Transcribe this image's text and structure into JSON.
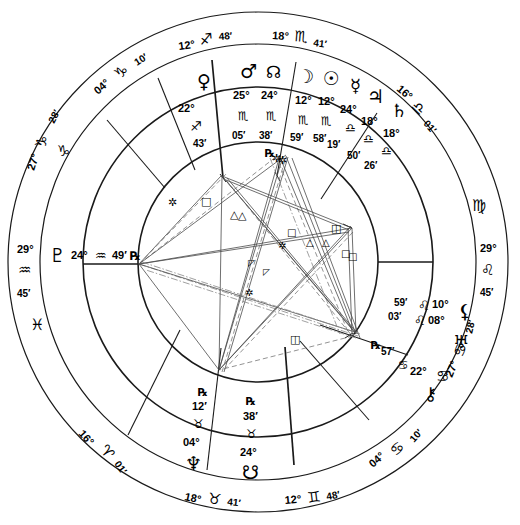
{
  "chart": {
    "type": "astrological-natal-wheel",
    "zodiac_glyphs": {
      "aries": "♈",
      "taurus": "♉",
      "gemini": "♊",
      "cancer": "♋",
      "leo": "♌",
      "virgo": "♍",
      "libra": "♎",
      "scorpio": "♏",
      "sagittarius": "♐",
      "capricorn": "♑",
      "aquarius": "♒",
      "pisces": "♓"
    },
    "planet_glyphs": {
      "sun": "☉",
      "moon": "☽",
      "mercury": "☿",
      "venus": "♀",
      "mars": "♂",
      "jupiter": "♃",
      "saturn": "♄",
      "uranus": "♅",
      "neptune": "♆",
      "pluto": "♇",
      "north_node": "☊",
      "south_node": "☋",
      "chiron": "⚷",
      "lilith": "⚸",
      "retrograde": "℞"
    },
    "house_cusps": [
      {
        "index": 1,
        "name": "cusp-asc",
        "degree": "29°",
        "sign": "aquarius",
        "sign_glyph": "♒",
        "minute": "45′",
        "label": "29° ♒ 45′"
      },
      {
        "index": 2,
        "name": "cusp-2",
        "degree": "16°",
        "sign": "aries",
        "sign_glyph": "♈",
        "minute": "01′",
        "label": "16° ♈ 01′"
      },
      {
        "index": 3,
        "name": "cusp-3",
        "degree": "18°",
        "sign": "taurus",
        "sign_glyph": "♉",
        "minute": "41′",
        "label": "18° ♉ 41′"
      },
      {
        "index": 4,
        "name": "cusp-ic",
        "degree": "12°",
        "sign": "gemini",
        "sign_glyph": "♊",
        "minute": "48′",
        "label": "12° ♊ 48′"
      },
      {
        "index": 5,
        "name": "cusp-5",
        "degree": "04°",
        "sign": "cancer",
        "sign_glyph": "♋",
        "minute": "10′",
        "label": "04° ♋ 10′"
      },
      {
        "index": 6,
        "name": "cusp-6",
        "degree": "27°",
        "sign": "cancer",
        "sign_glyph": "♋",
        "minute": "28′",
        "label": "27° ♋ 28′"
      },
      {
        "index": 7,
        "name": "cusp-dsc",
        "degree": "29°",
        "sign": "leo",
        "sign_glyph": "♌",
        "minute": "45′",
        "label": "29° ♌ 45′"
      },
      {
        "index": 8,
        "name": "cusp-8",
        "degree": "16°",
        "sign": "libra",
        "sign_glyph": "♎",
        "minute": "01′",
        "label": "16° ♎ 01′"
      },
      {
        "index": 9,
        "name": "cusp-9",
        "degree": "18°",
        "sign": "scorpio",
        "sign_glyph": "♏",
        "minute": "41′",
        "label": "18° ♏ 41′"
      },
      {
        "index": 10,
        "name": "cusp-mc",
        "degree": "12°",
        "sign": "sagittarius",
        "sign_glyph": "♐",
        "minute": "48′",
        "label": "12° ♐ 48′"
      },
      {
        "index": 11,
        "name": "cusp-11",
        "degree": "04°",
        "sign": "capricorn",
        "sign_glyph": "♑",
        "minute": "10′",
        "label": "04° ♑ 10′"
      },
      {
        "index": 12,
        "name": "cusp-12",
        "degree": "27°",
        "sign": "capricorn",
        "sign_glyph": "♑",
        "minute": "28′",
        "label": "27° ♑ 28′"
      }
    ],
    "planets": [
      {
        "name": "venus",
        "glyph": "♀",
        "degree": "22°",
        "sign_glyph": "♐",
        "sign": "sagittarius",
        "minute": "43′",
        "retrograde": ""
      },
      {
        "name": "mars",
        "glyph": "♂",
        "degree": "25°",
        "sign_glyph": "♏",
        "sign": "scorpio",
        "minute": "05′",
        "retrograde": ""
      },
      {
        "name": "north-node",
        "glyph": "☊",
        "degree": "24°",
        "sign_glyph": "♏",
        "sign": "scorpio",
        "minute": "38′",
        "retrograde": "℞"
      },
      {
        "name": "moon",
        "glyph": "☽",
        "degree": "12°",
        "sign_glyph": "♏",
        "sign": "scorpio",
        "minute": "59′",
        "retrograde": ""
      },
      {
        "name": "sun",
        "glyph": "☉",
        "degree": "12°",
        "sign_glyph": "♏",
        "sign": "scorpio",
        "minute": "58′",
        "retrograde": ""
      },
      {
        "name": "mercury",
        "glyph": "☿",
        "degree": "24°",
        "sign_glyph": "♎",
        "sign": "libra",
        "minute": "19′",
        "retrograde": ""
      },
      {
        "name": "jupiter",
        "glyph": "♃",
        "degree": "18°",
        "sign_glyph": "♎",
        "sign": "libra",
        "minute": "50′",
        "retrograde": ""
      },
      {
        "name": "saturn",
        "glyph": "♄",
        "degree": "18°",
        "sign_glyph": "♎",
        "sign": "libra",
        "minute": "26′",
        "retrograde": ""
      },
      {
        "name": "lilith",
        "glyph": "⚸",
        "degree": "10°",
        "sign_glyph": "♌",
        "sign": "leo",
        "minute": "59′",
        "retrograde": ""
      },
      {
        "name": "uranus",
        "glyph": "♅",
        "degree": "08°",
        "sign_glyph": "♌",
        "sign": "leo",
        "minute": "03′",
        "retrograde": ""
      },
      {
        "name": "chiron",
        "glyph": "⚷",
        "degree": "22°",
        "sign_glyph": "♋",
        "sign": "cancer",
        "minute": "57′",
        "retrograde": "℞"
      },
      {
        "name": "south-node",
        "glyph": "☋",
        "degree": "24°",
        "sign_glyph": "♉",
        "sign": "taurus",
        "minute": "38′",
        "retrograde": "℞"
      },
      {
        "name": "neptune",
        "glyph": "♆",
        "degree": "04°",
        "sign_glyph": "♉",
        "sign": "taurus",
        "minute": "12′",
        "retrograde": "℞"
      },
      {
        "name": "pluto",
        "glyph": "♇",
        "degree": "24°",
        "sign_glyph": "♒",
        "sign": "aquarius",
        "minute": "49′",
        "retrograde": "℞"
      }
    ],
    "sign_ring_markers": [
      {
        "name": "sign-marker-capricorn",
        "glyph": "♑"
      },
      {
        "name": "sign-marker-pisces",
        "glyph": "♓"
      },
      {
        "name": "sign-marker-virgo",
        "glyph": "♍"
      },
      {
        "name": "sign-marker-cancer",
        "glyph": "♋"
      }
    ],
    "labels": {
      "mc_deg": "12°",
      "mc_sign": "♐",
      "mc_min": "48′",
      "nine_deg": "18°",
      "nine_sign": "♏",
      "nine_min": "41′",
      "eleven_deg": "04°",
      "eleven_sign": "♑",
      "eleven_min": "10′",
      "twelve_deg": "27°",
      "twelve_sign": "♑",
      "twelve_min": "28′",
      "asc_deg": "29°",
      "asc_sign": "♒",
      "asc_min": "45′",
      "two_deg": "16°",
      "two_sign": "♈",
      "two_min": "01′",
      "three_deg": "18°",
      "three_sign": "♉",
      "three_min": "41′",
      "ic_deg": "12°",
      "ic_sign": "♊",
      "ic_min": "48′",
      "five_deg": "04°",
      "five_sign": "♋",
      "five_min": "10′",
      "six_deg": "27°",
      "six_sign": "♋",
      "six_min": "28′",
      "dsc_deg": "29°",
      "dsc_sign": "♌",
      "dsc_min": "45′",
      "eight_deg": "16°",
      "eight_sign": "♎",
      "eight_min": "01′",
      "pluto_glyph": "♇",
      "pluto_deg": "24°",
      "pluto_sign": "♒",
      "pluto_min": "49′",
      "pluto_rx": "℞",
      "venus_glyph": "♀",
      "venus_deg": "22°",
      "venus_sign": "♐",
      "venus_min": "43′",
      "mars_glyph": "♂",
      "mars_deg": "25°",
      "mars_sign": "♏",
      "mars_min": "05′",
      "nnode_glyph": "☊",
      "nnode_deg": "24°",
      "nnode_sign": "♏",
      "nnode_min": "38′",
      "nnode_rx": "℞",
      "moon_glyph": "☽",
      "moon_deg": "12°",
      "moon_sign": "♏",
      "moon_min": "59′",
      "sun_glyph": "☉",
      "sun_deg": "12°",
      "sun_sign": "♏",
      "sun_min": "58′",
      "mercury_glyph": "☿",
      "mercury_deg": "24°",
      "mercury_sign": "♎",
      "mercury_min": "19′",
      "jupiter_glyph": "♃",
      "jupiter_deg": "18°",
      "jupiter_sign": "♎",
      "jupiter_min": "50′",
      "saturn_glyph": "♄",
      "saturn_deg": "18°",
      "saturn_sign": "♎",
      "saturn_min": "26′",
      "lilith_glyph": "⚸",
      "lilith_deg": "10°",
      "lilith_sign": "♌",
      "lilith_min": "59′",
      "uranus_glyph": "♅",
      "uranus_deg": "08°",
      "uranus_sign": "♌",
      "uranus_min": "03′",
      "chiron_glyph": "⚷",
      "chiron_deg": "22°",
      "chiron_sign": "♋",
      "chiron_min": "57′",
      "chiron_rx": "℞",
      "snode_glyph": "☋",
      "snode_deg": "24°",
      "snode_sign": "♉",
      "snode_min": "38′",
      "snode_rx": "℞",
      "neptune_glyph": "♆",
      "neptune_deg": "04°",
      "neptune_sign": "♉",
      "neptune_min": "12′",
      "neptune_rx": "℞",
      "virgo_marker": "♍",
      "pisces_marker": "♓",
      "cap_marker": "♑",
      "cancer_marker": "♋"
    },
    "aspect_glyphs": {
      "conjunction": "☌",
      "opposition": "☍",
      "trine": "△",
      "square": "□",
      "sextile": "✲",
      "quincunx": "☍",
      "semisextile": "⚹",
      "sesquiquadrate": "⚼"
    },
    "colors": {
      "ink": "#1a1a1a",
      "paper": "#ffffff",
      "aspect_line": "#4a4a4a",
      "aspect_line_light": "#888888"
    }
  }
}
